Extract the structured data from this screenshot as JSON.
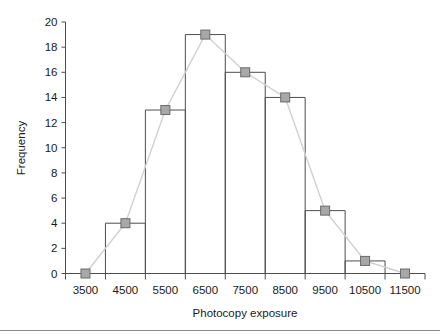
{
  "chart_data": {
    "type": "bar",
    "title": "",
    "subtitle": "",
    "xlabel": "Photocopy exposure",
    "ylabel": "Frequency",
    "categories": [
      "3500",
      "4500",
      "5500",
      "6500",
      "7500",
      "8500",
      "9500",
      "10500",
      "11500"
    ],
    "values": [
      0,
      4,
      13,
      19,
      16,
      14,
      5,
      1,
      0
    ],
    "xlim": [
      3000,
      12000
    ],
    "ylim": [
      0,
      20
    ],
    "bin_width": 1000,
    "y_ticks": [
      "0",
      "2",
      "4",
      "6",
      "8",
      "10",
      "12",
      "14",
      "16",
      "18",
      "20"
    ],
    "y_tick_values": [
      0,
      2,
      4,
      6,
      8,
      10,
      12,
      14,
      16,
      18,
      20
    ],
    "x_ticks": [
      "3500",
      "4500",
      "5500",
      "6500",
      "7500",
      "8500",
      "9500",
      "10500",
      "11500"
    ],
    "grid": false,
    "legend": "none",
    "series": [
      {
        "name": "histogram-bars",
        "kind": "bar",
        "values": [
          0,
          4,
          13,
          19,
          16,
          14,
          5,
          1,
          0
        ]
      },
      {
        "name": "frequency-polygon",
        "kind": "line",
        "values": [
          0,
          4,
          13,
          19,
          16,
          14,
          5,
          1,
          0
        ]
      }
    ],
    "colors": {
      "bar_stroke": "#4d4d4d",
      "bar_fill": "none",
      "polygon_line": "#d0d0d0",
      "marker_fill": "#a8a8a8",
      "marker_stroke": "#6a6a6a",
      "axis": "#4d4d4d",
      "text": "#1a1a1a",
      "background": "#ffffff",
      "foot_rule": "#8a8a8a"
    }
  }
}
